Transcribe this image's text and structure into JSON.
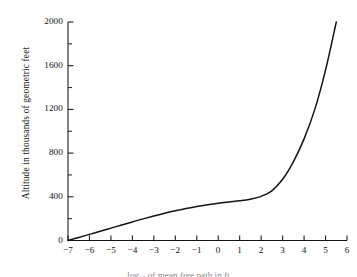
{
  "figure": {
    "background_color": "#fefefe",
    "ink_color": "#141414"
  },
  "axes": {
    "y_title": "Altitude in thousands of geometric feet",
    "x_title": "log₁₀ of mean free path in ft"
  },
  "chart_data": {
    "type": "line",
    "title": "",
    "subtitle": "",
    "xlabel": "log₁₀ of mean free path in ft",
    "ylabel": "Altitude in thousands of geometric feet",
    "xlim": [
      -7,
      6
    ],
    "ylim": [
      0,
      2000
    ],
    "grid": false,
    "legend": "none",
    "x_major_ticks": [
      -7,
      -6,
      -5,
      -4,
      -3,
      -2,
      -1,
      0,
      1,
      2,
      3,
      4,
      5,
      6
    ],
    "x_tick_labels": [
      "−7",
      "−6",
      "−5",
      "−4",
      "−3",
      "−2",
      "−1",
      "0",
      "1",
      "2",
      "3",
      "4",
      "5",
      "6"
    ],
    "y_major_ticks": [
      0,
      400,
      800,
      1200,
      1600,
      2000
    ],
    "y_tick_labels": [
      "0",
      "400",
      "800",
      "1200",
      "1600",
      "2000"
    ],
    "y_minor_ticks": [
      200,
      600,
      1000,
      1400,
      1800
    ],
    "series": [
      {
        "name": "altitude vs mean free path",
        "x": [
          -7.0,
          -6.5,
          -6.0,
          -5.5,
          -5.0,
          -4.5,
          -4.0,
          -3.5,
          -3.0,
          -2.5,
          -2.0,
          -1.5,
          -1.0,
          -0.5,
          0.0,
          0.5,
          1.0,
          1.5,
          2.0,
          2.5,
          3.0,
          3.5,
          4.0,
          4.5,
          5.0,
          5.5
        ],
        "y": [
          0,
          28,
          56,
          85,
          113,
          142,
          170,
          198,
          224,
          249,
          272,
          293,
          312,
          328,
          342,
          353,
          363,
          378,
          404,
          455,
          560,
          720,
          930,
          1200,
          1560,
          2000
        ]
      }
    ]
  }
}
